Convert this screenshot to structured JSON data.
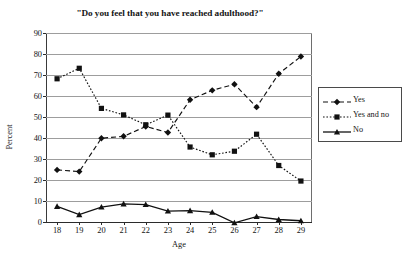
{
  "chart_data": {
    "type": "line",
    "title": "\"Do you feel that you have reached adulthood?\"",
    "xlabel": "Age",
    "ylabel": "Percent",
    "x": [
      18,
      19,
      20,
      21,
      22,
      23,
      24,
      25,
      26,
      27,
      28,
      29
    ],
    "categories": [
      "18",
      "19",
      "20",
      "21",
      "22",
      "23",
      "24",
      "25",
      "26",
      "27",
      "28",
      "29"
    ],
    "xlim": [
      17.5,
      29.5
    ],
    "ylim": [
      0,
      90
    ],
    "yticks": [
      0,
      10,
      20,
      30,
      40,
      50,
      60,
      70,
      80,
      90
    ],
    "ytick_labels": [
      "0",
      "10",
      "20",
      "30",
      "40",
      "50",
      "60",
      "70",
      "80",
      "90"
    ],
    "grid": "horizontal",
    "legend_position": "right",
    "series": [
      {
        "name": "Yes",
        "marker": "diamond",
        "line_style": "dashed",
        "color": "#111111",
        "values": [
          24.8,
          24.0,
          39.9,
          40.8,
          45.5,
          42.6,
          58.2,
          62.7,
          65.6,
          54.7,
          70.6,
          78.8
        ]
      },
      {
        "name": "Yes and no",
        "marker": "square",
        "line_style": "dotted",
        "color": "#111111",
        "values": [
          68.2,
          73.2,
          54.1,
          51.0,
          46.3,
          50.9,
          35.7,
          32.0,
          33.7,
          41.8,
          26.9,
          19.5
        ]
      },
      {
        "name": "No",
        "marker": "triangle",
        "line_style": "solid",
        "color": "#111111",
        "values": [
          7.4,
          3.5,
          7.1,
          8.6,
          8.3,
          5.2,
          5.4,
          4.6,
          -0.4,
          2.6,
          1.2,
          0.6
        ]
      }
    ]
  }
}
